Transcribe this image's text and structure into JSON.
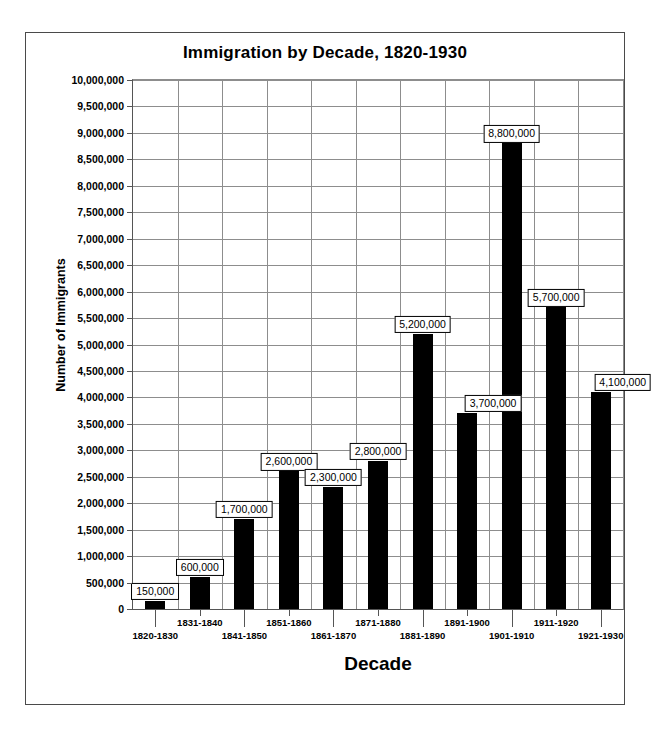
{
  "chart_data": {
    "type": "bar",
    "title": "Immigration by Decade, 1820-1930",
    "xlabel": "Decade",
    "ylabel": "Number of Immigrants",
    "categories": [
      "1820-1830",
      "1831-1840",
      "1841-1850",
      "1851-1860",
      "1861-1870",
      "1871-1880",
      "1881-1890",
      "1891-1900",
      "1901-1910",
      "1911-1920",
      "1921-1930"
    ],
    "values": [
      150000,
      600000,
      1700000,
      2600000,
      2300000,
      2800000,
      5200000,
      3700000,
      8800000,
      5700000,
      4100000
    ],
    "data_labels": [
      "150,000",
      "600,000",
      "1,700,000",
      "2,600,000",
      "2,300,000",
      "2,800,000",
      "5,200,000",
      "3,700,000",
      "8,800,000",
      "5,700,000",
      "4,100,000"
    ],
    "ylim": [
      0,
      10000000
    ],
    "ytick_values": [
      0,
      500000,
      1000000,
      1500000,
      2000000,
      2500000,
      3000000,
      3500000,
      4000000,
      4500000,
      5000000,
      5500000,
      6000000,
      6500000,
      7000000,
      7500000,
      8000000,
      8500000,
      9000000,
      9500000,
      10000000
    ],
    "ytick_labels": [
      "0",
      "500,000",
      "1,000,000",
      "1,500,000",
      "2,000,000",
      "2,500,000",
      "3,000,000",
      "3,500,000",
      "4,000,000",
      "4,500,000",
      "5,000,000",
      "5,500,000",
      "6,000,000",
      "6,500,000",
      "7,000,000",
      "7,500,000",
      "8,000,000",
      "8,500,000",
      "9,000,000",
      "9,500,000",
      "10,000,000"
    ],
    "grid": true,
    "legend": false,
    "bar_color": "#000000",
    "grid_color": "#8d8d8d",
    "axis_color": "#555555",
    "frame_color": "#4a4a4a",
    "background": "#ffffff",
    "label_offsets_px": [
      0,
      0,
      0,
      0,
      0,
      0,
      0,
      26,
      0,
      0,
      22
    ]
  }
}
